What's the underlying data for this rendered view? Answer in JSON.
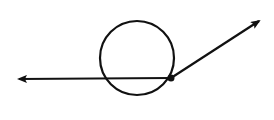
{
  "diagram": {
    "colors": {
      "stroke": "#111111",
      "background": "#ffffff"
    },
    "circle": {
      "cx": 137,
      "cy": 58,
      "r": 37
    },
    "point": {
      "x": 171,
      "y": 78
    },
    "ray_left": {
      "x2": 17,
      "y2": 79
    },
    "ray_right": {
      "x2": 261,
      "y2": 20
    }
  }
}
